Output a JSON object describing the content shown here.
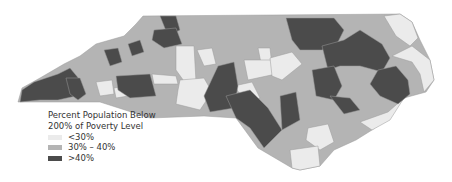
{
  "map": {
    "region": "North Carolina counties",
    "legend": {
      "title_line1": "Percent Population Below",
      "title_line2": "200% of Poverty Level",
      "items": [
        {
          "label": "<30%",
          "color": "#ebebeb"
        },
        {
          "label": "30% – 40%",
          "color": "#b4b4b4"
        },
        {
          "label": ">40%",
          "color": "#4b4b4b"
        }
      ]
    }
  }
}
